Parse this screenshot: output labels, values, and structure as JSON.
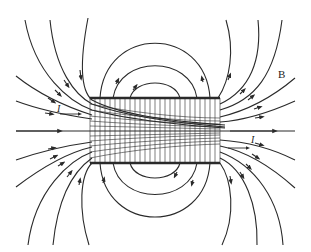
{
  "diagram": {
    "labels": {
      "field": "B",
      "current_left": "I",
      "current_right": "I"
    },
    "colors": {
      "line": "#2a2a2a",
      "background": "#ffffff"
    },
    "solenoid": {
      "x": 90,
      "y": 98,
      "width": 130,
      "height": 65,
      "turns": 26
    }
  }
}
